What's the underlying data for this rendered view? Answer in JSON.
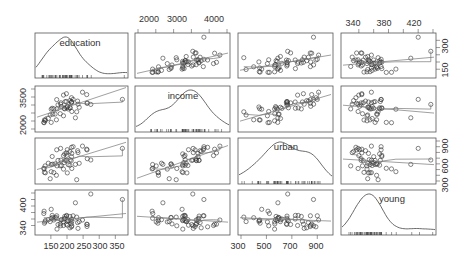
{
  "chart_data": {
    "type": "scatter",
    "subtype": "scatterplot-matrix",
    "title": "",
    "variables": [
      "education",
      "income",
      "urban",
      "young"
    ],
    "diagonal": "density",
    "smoothers": [
      "linear",
      "loess"
    ],
    "ranges": {
      "education": [
        110,
        380
      ],
      "income": [
        2000,
        4500
      ],
      "urban": [
        300,
        1000
      ],
      "young": [
        320,
        440
      ]
    },
    "axes": {
      "top": [
        {
          "var": "income",
          "ticks": [
            2000,
            3000,
            4000
          ]
        },
        {
          "var": "young",
          "ticks": [
            340,
            380,
            420
          ]
        }
      ],
      "bottom": [
        {
          "var": "education",
          "ticks": [
            150,
            200,
            250,
            300,
            350
          ]
        },
        {
          "var": "urban",
          "ticks": [
            300,
            500,
            700,
            900
          ]
        }
      ],
      "left": [
        {
          "var": "income",
          "ticks": [
            2000,
            3500
          ]
        },
        {
          "var": "young",
          "ticks": [
            340,
            400
          ]
        }
      ],
      "right": [
        {
          "var": "education",
          "ticks": [
            150,
            300
          ]
        },
        {
          "var": "urban",
          "ticks": [
            300,
            600,
            900
          ]
        }
      ]
    },
    "observations": [
      {
        "education": 189,
        "income": 2824,
        "urban": 508,
        "young": 351
      },
      {
        "education": 169,
        "income": 3259,
        "urban": 564,
        "young": 329
      },
      {
        "education": 230,
        "income": 3072,
        "urban": 322,
        "young": 366
      },
      {
        "education": 168,
        "income": 3835,
        "urban": 846,
        "young": 370
      },
      {
        "education": 180,
        "income": 3549,
        "urban": 871,
        "young": 339
      },
      {
        "education": 193,
        "income": 3256,
        "urban": 774,
        "young": 368
      },
      {
        "education": 261,
        "income": 4151,
        "urban": 856,
        "young": 344
      },
      {
        "education": 214,
        "income": 3954,
        "urban": 889,
        "young": 336
      },
      {
        "education": 201,
        "income": 3419,
        "urban": 848,
        "young": 341
      },
      {
        "education": 172,
        "income": 3509,
        "urban": 660,
        "young": 343
      },
      {
        "education": 194,
        "income": 3712,
        "urban": 661,
        "young": 362
      },
      {
        "education": 189,
        "income": 4121,
        "urban": 745,
        "young": 340
      },
      {
        "education": 233,
        "income": 3745,
        "urban": 830,
        "young": 349
      },
      {
        "education": 209,
        "income": 3776,
        "urban": 817,
        "young": 333
      },
      {
        "education": 262,
        "income": 3605,
        "urban": 845,
        "young": 337
      },
      {
        "education": 234,
        "income": 3552,
        "urban": 797,
        "young": 331
      },
      {
        "education": 263,
        "income": 3629,
        "urban": 690,
        "young": 343
      },
      {
        "education": 198,
        "income": 4205,
        "urban": 791,
        "young": 344
      },
      {
        "education": 213,
        "income": 3643,
        "urban": 657,
        "young": 346
      },
      {
        "education": 154,
        "income": 3295,
        "urban": 728,
        "young": 371
      },
      {
        "education": 183,
        "income": 3401,
        "urban": 572,
        "young": 358
      },
      {
        "education": 215,
        "income": 3685,
        "urban": 783,
        "young": 353
      },
      {
        "education": 198,
        "income": 3716,
        "urban": 662,
        "young": 369
      },
      {
        "education": 214,
        "income": 3685,
        "urban": 726,
        "young": 360
      },
      {
        "education": 181,
        "income": 3636,
        "urban": 664,
        "young": 357
      },
      {
        "education": 159,
        "income": 3262,
        "urban": 447,
        "young": 357
      },
      {
        "education": 151,
        "income": 3238,
        "urban": 463,
        "young": 390
      },
      {
        "education": 201,
        "income": 3374,
        "urban": 441,
        "young": 353
      },
      {
        "education": 148,
        "income": 2875,
        "urban": 340,
        "young": 352
      },
      {
        "education": 209,
        "income": 3327,
        "urban": 576,
        "young": 368
      },
      {
        "education": 156,
        "income": 2927,
        "urban": 594,
        "young": 365
      },
      {
        "education": 215,
        "income": 3091,
        "urban": 518,
        "young": 339
      },
      {
        "education": 179,
        "income": 2954,
        "urban": 566,
        "young": 345
      },
      {
        "education": 238,
        "income": 3355,
        "urban": 610,
        "young": 352
      },
      {
        "education": 191,
        "income": 3287,
        "urban": 622,
        "young": 360
      },
      {
        "education": 204,
        "income": 3252,
        "urban": 585,
        "young": 355
      },
      {
        "education": 210,
        "income": 3327,
        "urban": 673,
        "young": 354
      },
      {
        "education": 142,
        "income": 2659,
        "urban": 611,
        "young": 358
      },
      {
        "education": 130,
        "income": 2560,
        "urban": 450,
        "young": 347
      },
      {
        "education": 167,
        "income": 2576,
        "urban": 400,
        "young": 364
      },
      {
        "education": 133,
        "income": 2570,
        "urban": 444,
        "young": 355
      },
      {
        "education": 151,
        "income": 2410,
        "urban": 589,
        "young": 362
      },
      {
        "education": 129,
        "income": 2395,
        "urban": 512,
        "young": 384
      },
      {
        "education": 128,
        "income": 2415,
        "urban": 523,
        "young": 377
      },
      {
        "education": 132,
        "income": 2510,
        "urban": 564,
        "young": 351
      },
      {
        "education": 163,
        "income": 2930,
        "urban": 600,
        "young": 364
      },
      {
        "education": 274,
        "income": 3540,
        "urban": 667,
        "young": 437
      },
      {
        "education": 199,
        "income": 3320,
        "urban": 750,
        "young": 371
      },
      {
        "education": 219,
        "income": 3850,
        "urban": 900,
        "young": 370
      },
      {
        "education": 372,
        "income": 3850,
        "urban": 870,
        "young": 420
      },
      {
        "education": 226,
        "income": 2700,
        "urban": 590,
        "young": 410
      },
      {
        "education": 248,
        "income": 4300,
        "urban": 910,
        "young": 357
      }
    ]
  },
  "labels": {
    "v0": "education",
    "v1": "income",
    "v2": "urban",
    "v3": "young",
    "top_ticks_income": [
      "2000",
      "3000",
      "4000"
    ],
    "top_ticks_young": [
      "340",
      "380",
      "420"
    ],
    "bottom_ticks_education": [
      "150",
      "200",
      "250",
      "300",
      "350"
    ],
    "bottom_ticks_urban": [
      "300",
      "500",
      "700",
      "900"
    ],
    "left_ticks_income": [
      "2000",
      "3500"
    ],
    "left_ticks_young": [
      "340",
      "400"
    ],
    "right_ticks_education": [
      "150",
      "300"
    ],
    "right_ticks_urban": [
      "300",
      "600",
      "900"
    ]
  }
}
